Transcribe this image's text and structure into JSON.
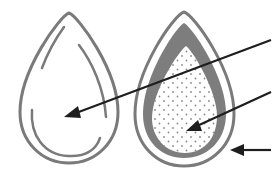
{
  "diagram": {
    "type": "labeled-structure-diagram",
    "colors": {
      "background": "#ffffff",
      "outline": "#7a7a7a",
      "shell_band": "#7d7d7d",
      "inner_fill": "#ffffff",
      "dots": "#8a8a8a",
      "arrow": "#1e1e1e"
    },
    "figures": [
      {
        "id": "left-drop",
        "description": "Plain teardrop outline with inner highlight strokes",
        "pointer_arrow": "arrow-1"
      },
      {
        "id": "right-drop",
        "description": "Teardrop cross-section: thin outer outline, thick grey middle layer, dotted inner core",
        "pointer_arrows": [
          "arrow-2",
          "arrow-3"
        ]
      }
    ],
    "arrows": [
      {
        "id": "arrow-1",
        "target": "left-drop interior",
        "label": ""
      },
      {
        "id": "arrow-2",
        "target": "right-drop dotted core",
        "label": ""
      },
      {
        "id": "arrow-3",
        "target": "right-drop outer layer",
        "label": ""
      }
    ]
  }
}
